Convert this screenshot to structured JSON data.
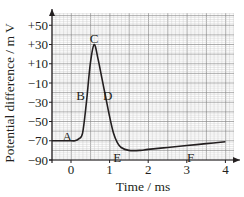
{
  "chart_data": {
    "type": "line",
    "title": "",
    "xlabel": "Time / ms",
    "ylabel": "Potential difference / m V",
    "xlim": [
      -0.5,
      4.2
    ],
    "ylim": [
      -90,
      60
    ],
    "grid": true,
    "x_ticks": [
      "0",
      "1",
      "2",
      "3",
      "4"
    ],
    "y_ticks": [
      "+50",
      "+30",
      "+10",
      "−10",
      "−30",
      "−50",
      "−70",
      "−90"
    ],
    "series": [
      {
        "name": "action potential",
        "x": [
          -0.5,
          0.0,
          0.1,
          0.2,
          0.3,
          0.4,
          0.5,
          0.6,
          0.7,
          0.8,
          0.9,
          1.0,
          1.1,
          1.2,
          1.3,
          1.5,
          1.8,
          2.0,
          2.5,
          3.0,
          3.5,
          4.0
        ],
        "values": [
          -70,
          -70,
          -70,
          -68,
          -62,
          -30,
          10,
          30,
          15,
          -5,
          -25,
          -45,
          -62,
          -72,
          -77,
          -80,
          -80,
          -79,
          -77,
          -75,
          -73,
          -71
        ]
      }
    ],
    "annotations": [
      {
        "label": "A",
        "x": -0.1,
        "y": -66
      },
      {
        "label": "B",
        "x": 0.25,
        "y": -24
      },
      {
        "label": "C",
        "x": 0.6,
        "y": 36
      },
      {
        "label": "D",
        "x": 0.95,
        "y": -24
      },
      {
        "label": "E",
        "x": 1.2,
        "y": -88
      },
      {
        "label": "F",
        "x": 3.1,
        "y": -88
      }
    ]
  },
  "labels": {
    "x_axis": "Time / ms",
    "y_axis": "Potential difference / m V",
    "points": [
      "A",
      "B",
      "C",
      "D",
      "E",
      "F"
    ]
  }
}
